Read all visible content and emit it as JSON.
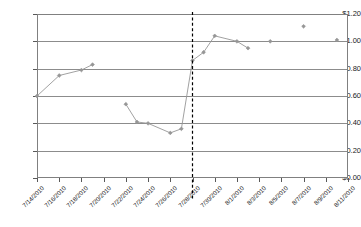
{
  "chart_data": {
    "type": "line",
    "title": "",
    "xlabel": "",
    "ylabel": "",
    "ylim": [
      0,
      1.2
    ],
    "ytick_values": [
      0.0,
      0.2,
      0.4,
      0.6,
      0.8,
      1.0,
      1.2
    ],
    "ytick_labels": [
      "$0.00",
      "$0.20",
      "$0.40",
      "$0.60",
      "$0.80",
      "$1.00",
      "$1.20"
    ],
    "grid": true,
    "legend": "none",
    "xtick_labels": [
      "7/14/2010",
      "7/16/2010",
      "7/18/2010",
      "7/20/2010",
      "7/22/2010",
      "7/24/2010",
      "7/26/2010",
      "7/28/2010",
      "7/30/2010",
      "8/1/2010",
      "8/3/2010",
      "8/5/2010",
      "8/7/2010",
      "8/9/2010",
      "8/11/2010"
    ],
    "x_range": [
      "7/14/2010",
      "8/11/2010"
    ],
    "annotations": [
      {
        "name": "event-reference-line",
        "type": "vertical-dashed-line",
        "x": "7/28/2010",
        "color": "#000000"
      }
    ],
    "series": [
      {
        "name": "price",
        "marker": "diamond",
        "color": "#969696",
        "points": [
          {
            "x": "7/14/2010",
            "y": 0.6,
            "connected": true
          },
          {
            "x": "7/16/2010",
            "y": 0.75,
            "connected": true
          },
          {
            "x": "7/18/2010",
            "y": 0.79,
            "connected": true
          },
          {
            "x": "7/19/2010",
            "y": 0.83,
            "connected": true
          },
          {
            "x": "7/22/2010",
            "y": 0.54,
            "connected": false
          },
          {
            "x": "7/23/2010",
            "y": 0.41,
            "connected": true
          },
          {
            "x": "7/24/2010",
            "y": 0.4,
            "connected": true
          },
          {
            "x": "7/26/2010",
            "y": 0.33,
            "connected": true
          },
          {
            "x": "7/27/2010",
            "y": 0.36,
            "connected": true
          },
          {
            "x": "7/28/2010",
            "y": 0.86,
            "connected": true
          },
          {
            "x": "7/29/2010",
            "y": 0.92,
            "connected": true
          },
          {
            "x": "7/30/2010",
            "y": 1.04,
            "connected": true
          },
          {
            "x": "8/1/2010",
            "y": 1.0,
            "connected": true
          },
          {
            "x": "8/2/2010",
            "y": 0.95,
            "connected": true
          },
          {
            "x": "8/4/2010",
            "y": 1.0,
            "connected": false
          },
          {
            "x": "8/7/2010",
            "y": 1.11,
            "connected": false
          },
          {
            "x": "8/10/2010",
            "y": 1.01,
            "connected": false
          }
        ]
      }
    ]
  }
}
